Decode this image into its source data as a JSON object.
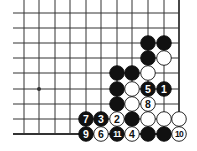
{
  "diagram": {
    "type": "go-board-corner",
    "colors": {
      "background": "#ffffff",
      "grid": "#333333",
      "black_stone": "#111111",
      "white_stone": "#ffffff",
      "stone_outline": "#111111"
    },
    "grid": {
      "columns_x": [
        24,
        39,
        55,
        70,
        86,
        101,
        117,
        132,
        148,
        164,
        179
      ],
      "rows_y": [
        13,
        28,
        43,
        58,
        73,
        89,
        104,
        119,
        134
      ],
      "line_start_x": 13,
      "top_extend_y": 0,
      "edge_bottom": true,
      "edge_right": true,
      "stone_radius": 7.3
    },
    "star_points": [
      {
        "col": 1,
        "row": 5
      }
    ],
    "stones": [
      {
        "col": 8,
        "row": 2,
        "color": "black",
        "label": ""
      },
      {
        "col": 9,
        "row": 2,
        "color": "black",
        "label": ""
      },
      {
        "col": 8,
        "row": 3,
        "color": "black",
        "label": ""
      },
      {
        "col": 9,
        "row": 3,
        "color": "white",
        "label": ""
      },
      {
        "col": 6,
        "row": 4,
        "color": "black",
        "label": ""
      },
      {
        "col": 7,
        "row": 4,
        "color": "black",
        "label": ""
      },
      {
        "col": 8,
        "row": 4,
        "color": "white",
        "label": ""
      },
      {
        "col": 6,
        "row": 5,
        "color": "black",
        "label": ""
      },
      {
        "col": 7,
        "row": 5,
        "color": "white",
        "label": ""
      },
      {
        "col": 8,
        "row": 5,
        "color": "black",
        "label": "5"
      },
      {
        "col": 9,
        "row": 5,
        "color": "black",
        "label": "1"
      },
      {
        "col": 6,
        "row": 6,
        "color": "black",
        "label": ""
      },
      {
        "col": 7,
        "row": 6,
        "color": "white",
        "label": ""
      },
      {
        "col": 8,
        "row": 6,
        "color": "white",
        "label": "8"
      },
      {
        "col": 4,
        "row": 7,
        "color": "black",
        "label": "7"
      },
      {
        "col": 5,
        "row": 7,
        "color": "black",
        "label": "3"
      },
      {
        "col": 6,
        "row": 7,
        "color": "white",
        "label": "2"
      },
      {
        "col": 7,
        "row": 7,
        "color": "black",
        "label": ""
      },
      {
        "col": 8,
        "row": 7,
        "color": "white",
        "label": ""
      },
      {
        "col": 9,
        "row": 7,
        "color": "white",
        "label": ""
      },
      {
        "col": 10,
        "row": 7,
        "color": "white",
        "label": ""
      },
      {
        "col": 4,
        "row": 8,
        "color": "black",
        "label": "9"
      },
      {
        "col": 5,
        "row": 8,
        "color": "white",
        "label": "6"
      },
      {
        "col": 6,
        "row": 8,
        "color": "black",
        "label": "11"
      },
      {
        "col": 7,
        "row": 8,
        "color": "white",
        "label": "4"
      },
      {
        "col": 8,
        "row": 8,
        "color": "black",
        "label": ""
      },
      {
        "col": 9,
        "row": 8,
        "color": "black",
        "label": ""
      },
      {
        "col": 10,
        "row": 8,
        "color": "white",
        "label": "10"
      }
    ]
  }
}
